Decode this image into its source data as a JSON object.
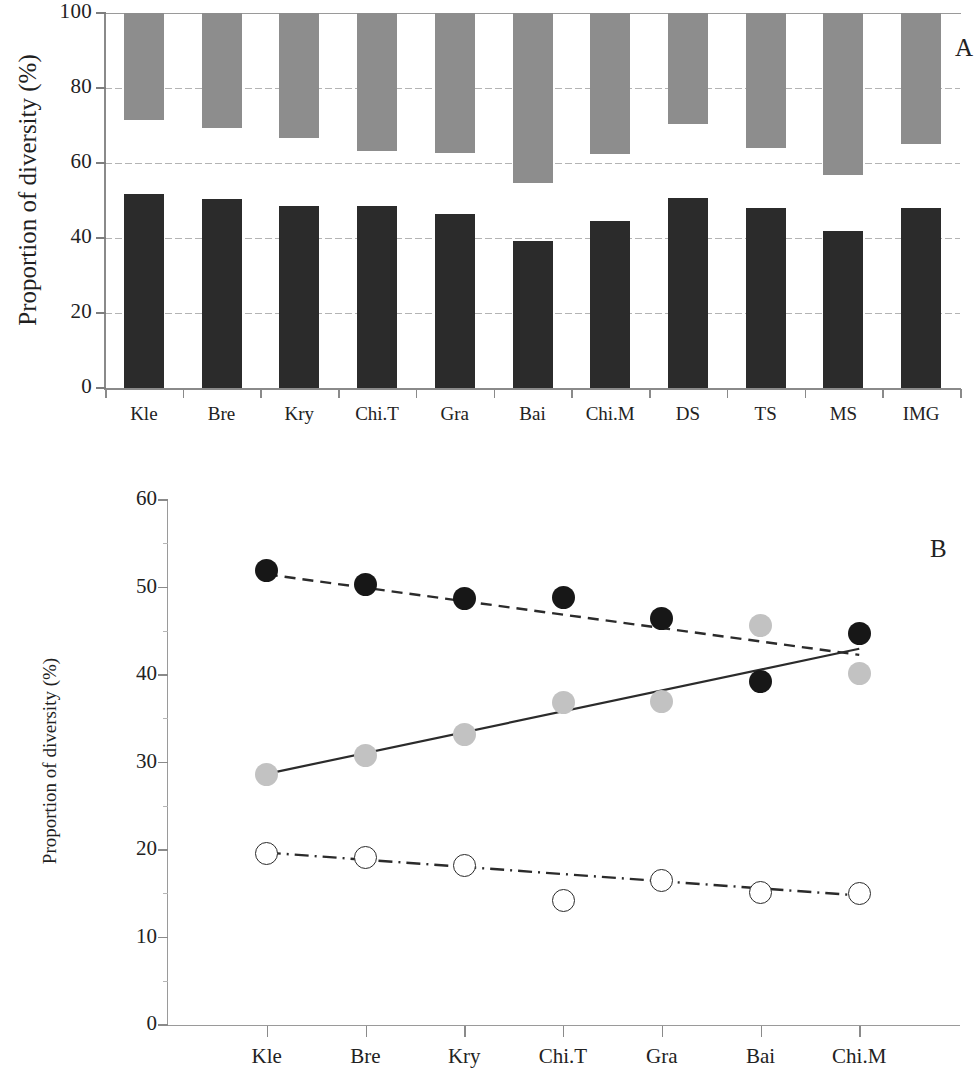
{
  "figure": {
    "panel_a_label": "A",
    "panel_b_label": "B"
  },
  "panel_a": {
    "ylabel": "Proportion of diversity (%)",
    "yticks": [
      "0",
      "20",
      "40",
      "60",
      "80",
      "100"
    ],
    "categories": [
      "Kle",
      "Bre",
      "Kry",
      "Chi.T",
      "Gra",
      "Bai",
      "Chi.M",
      "DS",
      "TS",
      "MS",
      "IMG"
    ]
  },
  "panel_b": {
    "ylabel": "Proportion of diversity (%)",
    "yticks": [
      "0",
      "10",
      "20",
      "30",
      "40",
      "50",
      "60"
    ],
    "categories": [
      "Kle",
      "Bre",
      "Kry",
      "Chi.T",
      "Gra",
      "Bai",
      "Chi.M"
    ]
  },
  "chart_data": [
    {
      "type": "bar",
      "panel": "A",
      "title": "",
      "xlabel": "",
      "ylabel": "Proportion of diversity (%)",
      "ylim": [
        0,
        100
      ],
      "grid": true,
      "stacked": "floating-segments",
      "categories": [
        "Kle",
        "Bre",
        "Kry",
        "Chi.T",
        "Gra",
        "Bai",
        "Chi.M",
        "DS",
        "TS",
        "MS",
        "IMG"
      ],
      "series": [
        {
          "name": "dark-segment",
          "color": "#2b2b2b",
          "base": 0,
          "values": [
            51.8,
            50.3,
            48.6,
            48.6,
            46.4,
            39.3,
            44.5,
            50.8,
            48.1,
            42.0,
            48.0
          ]
        },
        {
          "name": "light-segment",
          "color": "#8d8d8d",
          "top": 100,
          "bottoms": [
            71.6,
            69.3,
            66.8,
            63.2,
            62.6,
            54.8,
            62.4,
            70.4,
            64.1,
            56.8,
            65.0
          ],
          "values": [
            28.4,
            30.7,
            33.2,
            36.8,
            37.4,
            45.2,
            37.6,
            29.6,
            35.9,
            43.2,
            35.0
          ]
        }
      ]
    },
    {
      "type": "scatter",
      "panel": "B",
      "title": "",
      "xlabel": "",
      "ylabel": "Proportion of diversity (%)",
      "ylim": [
        0,
        60
      ],
      "grid": false,
      "categories": [
        "Kle",
        "Bre",
        "Kry",
        "Chi.T",
        "Gra",
        "Bai",
        "Chi.M"
      ],
      "series": [
        {
          "name": "filled-black-circles",
          "marker": "filled-circle",
          "color": "#171717",
          "line_style": "dashed",
          "values": [
            52.0,
            50.4,
            48.7,
            48.9,
            46.5,
            39.3,
            44.8
          ],
          "trend_start": 51.5,
          "trend_end": 42.3
        },
        {
          "name": "gray-circles",
          "marker": "filled-circle",
          "color": "#c2c2c2",
          "line_style": "solid",
          "values": [
            28.6,
            30.8,
            33.2,
            36.9,
            37.0,
            45.7,
            40.2
          ],
          "trend_start": 28.7,
          "trend_end": 43.0
        },
        {
          "name": "open-circles",
          "marker": "open-circle",
          "color": "#ffffff",
          "line_style": "dash-dot",
          "values": [
            19.6,
            19.1,
            18.2,
            14.2,
            16.5,
            15.1,
            15.0
          ],
          "trend_start": 19.7,
          "trend_end": 14.8
        }
      ]
    }
  ],
  "colors": {
    "dark_bar": "#2b2b2b",
    "light_bar": "#8d8d8d",
    "black_marker": "#171717",
    "gray_marker": "#c2c2c2",
    "axis": "#8a8a8a",
    "grid": "#b4b4b4"
  }
}
